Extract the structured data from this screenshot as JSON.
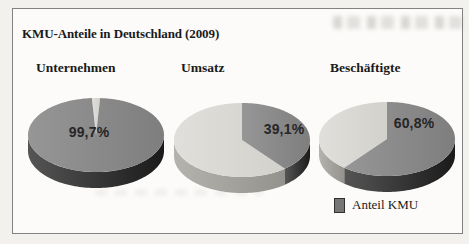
{
  "figure": {
    "title": "KMU-Anteile in Deutschland (2009)",
    "legend": {
      "label": "Anteil KMU"
    }
  },
  "theme": {
    "page_bg": "#f2f1ee",
    "frame_bg": "#fcfbf9",
    "frame_border": "#828282",
    "text": "#1a1a1a",
    "value_text": "#262626",
    "kmu_top_left": "#969696",
    "kmu_top_right": "#7e7e7e",
    "kmu_side_left": "#555555",
    "kmu_side_right": "#1a1a1a",
    "rest_top_left": "#e0dfdb",
    "rest_top_right": "#d3d1cc",
    "rest_side_left": "#b4b3ad",
    "rest_side_right": "#93928c",
    "legend_swatch_fill": "#767676",
    "legend_swatch_border": "#2f2f2f"
  },
  "chart_data": [
    {
      "type": "pie",
      "title": "Unternehmen",
      "unit": "%",
      "legend": "Anteil KMU",
      "slices": [
        {
          "name": "Anteil KMU",
          "value": 99.7,
          "label": "99,7%"
        },
        {
          "name": "Rest",
          "value": 0.3,
          "label": ""
        }
      ]
    },
    {
      "type": "pie",
      "title": "Umsatz",
      "unit": "%",
      "legend": "Anteil KMU",
      "slices": [
        {
          "name": "Anteil KMU",
          "value": 39.1,
          "label": "39,1%"
        },
        {
          "name": "Rest",
          "value": 60.9,
          "label": ""
        }
      ]
    },
    {
      "type": "pie",
      "title": "Beschäftigte",
      "unit": "%",
      "legend": "Anteil KMU",
      "slices": [
        {
          "name": "Anteil KMU",
          "value": 60.8,
          "label": "60,8%"
        },
        {
          "name": "Rest",
          "value": 39.2,
          "label": ""
        }
      ]
    }
  ]
}
